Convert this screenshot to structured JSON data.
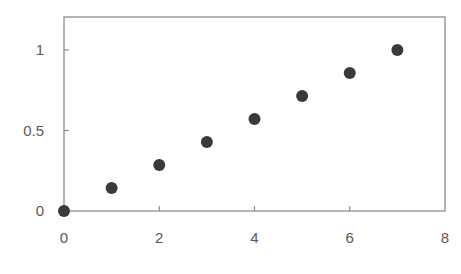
{
  "chart_data": {
    "type": "scatter",
    "title": "",
    "xlabel": "",
    "ylabel": "",
    "xlim": [
      0,
      8
    ],
    "ylim": [
      0,
      1.2
    ],
    "x_ticks": [
      0,
      2,
      4,
      6,
      8
    ],
    "y_ticks": [
      0,
      0.5,
      1
    ],
    "x_tick_labels": [
      "0",
      "2",
      "4",
      "6",
      "8"
    ],
    "y_tick_labels": [
      "0",
      "0.5",
      "1"
    ],
    "grid": false,
    "legend": null,
    "series": [
      {
        "name": "Series1",
        "marker": "circle",
        "color": "#3a3a3a",
        "x": [
          0,
          1,
          2,
          3,
          4,
          5,
          6,
          7
        ],
        "y": [
          0,
          0.143,
          0.286,
          0.429,
          0.571,
          0.714,
          0.857,
          1.0
        ]
      }
    ]
  },
  "style": {
    "axis_color": "#8c8c8c",
    "label_color": "#595959",
    "marker_color": "#3a3a3a"
  }
}
